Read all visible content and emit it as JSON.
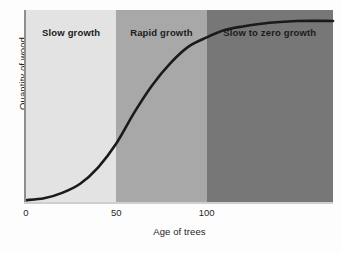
{
  "chart_data": {
    "type": "line",
    "title": "",
    "subtitle": "",
    "xlabel": "Age of trees",
    "ylabel": "Quantity of wood",
    "xlim": [
      0,
      170
    ],
    "ylim": [
      0,
      1.05
    ],
    "xticks": [
      {
        "value": 0,
        "label": "0"
      },
      {
        "value": 50,
        "label": "50"
      },
      {
        "value": 100,
        "label": "100"
      }
    ],
    "yticks": [],
    "grid": false,
    "legend": null,
    "series": [
      {
        "name": "Quantity of wood",
        "color": "#1a1a1a",
        "points": [
          {
            "x": 0,
            "y": 0.01
          },
          {
            "x": 10,
            "y": 0.02
          },
          {
            "x": 20,
            "y": 0.05
          },
          {
            "x": 30,
            "y": 0.1
          },
          {
            "x": 40,
            "y": 0.19
          },
          {
            "x": 50,
            "y": 0.32
          },
          {
            "x": 60,
            "y": 0.49
          },
          {
            "x": 70,
            "y": 0.64
          },
          {
            "x": 80,
            "y": 0.76
          },
          {
            "x": 90,
            "y": 0.85
          },
          {
            "x": 100,
            "y": 0.9
          },
          {
            "x": 110,
            "y": 0.94
          },
          {
            "x": 120,
            "y": 0.96
          },
          {
            "x": 135,
            "y": 0.98
          },
          {
            "x": 150,
            "y": 0.99
          },
          {
            "x": 170,
            "y": 0.99
          }
        ]
      }
    ],
    "annotations": [
      {
        "label": "Slow growth",
        "x_range": [
          0,
          50
        ],
        "shade": "#e3e3e3"
      },
      {
        "label": "Rapid growth",
        "x_range": [
          50,
          100
        ],
        "shade": "#a8a8a8"
      },
      {
        "label": "Slow to zero growth",
        "x_range": [
          100,
          170
        ],
        "shade": "#777777"
      }
    ],
    "bands": [
      {
        "label": "Slow growth",
        "color": "#e3e3e3"
      },
      {
        "label": "Rapid growth",
        "color": "#a8a8a8"
      },
      {
        "label": "Slow to zero growth",
        "color": "#777777"
      }
    ]
  }
}
